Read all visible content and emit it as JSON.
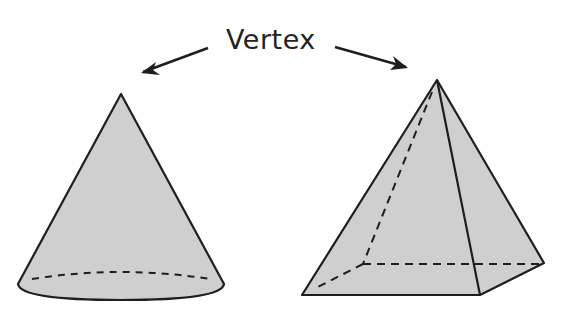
{
  "diagram": {
    "label": "Vertex",
    "colors": {
      "fill": "#cfcfcf",
      "stroke": "#1e1e1e",
      "background": "#ffffff"
    },
    "shapes": [
      {
        "name": "cone",
        "apex": [
          121,
          94
        ],
        "base_left": [
          18,
          284
        ],
        "base_right": [
          224,
          284
        ],
        "base_edge": "dashed back, solid front"
      },
      {
        "name": "square pyramid",
        "apex": [
          437,
          80
        ],
        "base_vertices": [
          [
            302,
            295
          ],
          [
            480,
            295
          ],
          [
            544,
            263
          ],
          [
            363,
            264
          ]
        ],
        "hidden_edges": "dashed"
      }
    ],
    "arrows": [
      {
        "from": [
          208,
          48
        ],
        "to": [
          142,
          73
        ],
        "points_to": "cone apex"
      },
      {
        "from": [
          335,
          47
        ],
        "to": [
          407,
          68
        ],
        "points_to": "pyramid apex"
      }
    ]
  }
}
